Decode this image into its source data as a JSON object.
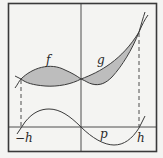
{
  "figure": {
    "labels": {
      "f": "f",
      "g": "g",
      "p": "p",
      "neg_h": "−h",
      "h": "h"
    },
    "colors": {
      "background": "#f4f4f2",
      "stroke": "#3a3a3a",
      "fill": "#bdbdbd"
    }
  }
}
